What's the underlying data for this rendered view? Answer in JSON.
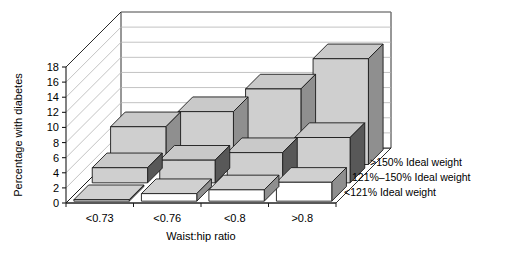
{
  "chart_data": {
    "type": "bar",
    "title": "",
    "subtitle": "",
    "xlabel": "Waist:hip ratio",
    "ylabel": "Percentage with diabetes",
    "categories": [
      "<0.73",
      "<0.76",
      "<0.8",
      ">0.8"
    ],
    "series": [
      {
        "name": "<121% Ideal weight",
        "values": [
          0.2,
          1.0,
          1.5,
          2.5
        ],
        "color": "#ffffff"
      },
      {
        "name": "121%-150% Ideal weight",
        "values": [
          2.0,
          3.0,
          4.0,
          6.0
        ],
        "color": "#c9c9c9"
      },
      {
        "name": ">150% Ideal weight",
        "values": [
          5.0,
          7.0,
          10.0,
          14.0
        ],
        "color": "#cccccc"
      }
    ],
    "ylim": [
      0,
      18
    ],
    "yticks": [
      0,
      2,
      4,
      6,
      8,
      10,
      12,
      14,
      16,
      18
    ],
    "ytick_labels": [
      "0",
      "2",
      "4",
      "6",
      "8",
      "10",
      "12",
      "14",
      "16",
      "18"
    ],
    "grid": true,
    "grid_axis": "y",
    "projection": "3d",
    "legend_position": "right",
    "legend_order_front_to_back": [
      "<121% Ideal weight",
      "121%-150% Ideal weight",
      ">150% Ideal weight"
    ]
  },
  "axes": {
    "y_title": "Percentage with diabetes",
    "x_title": "Waist:hip ratio",
    "y_ticks": [
      "0",
      "2",
      "4",
      "6",
      "8",
      "10",
      "12",
      "14",
      "16",
      "18"
    ],
    "x_categories": [
      "<0.73",
      "<0.76",
      "<0.8",
      ">0.8"
    ]
  },
  "legend": {
    "items": [
      {
        "label": ">150% Ideal weight"
      },
      {
        "label": "121%–150% Ideal weight"
      },
      {
        "label": "<121% Ideal weight"
      }
    ]
  },
  "colors": {
    "bar_top": "#c9c9c9",
    "bar_front_light": "#cfcfcf",
    "bar_front_white": "#ffffff",
    "bar_side_dark": "#585858",
    "bar_side_mid": "#8f8f8f",
    "axis": "#1a1a1a",
    "grid": "#b4b4b4",
    "background": "#ffffff"
  }
}
